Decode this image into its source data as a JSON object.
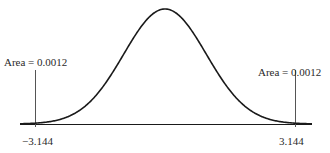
{
  "chart_data": {
    "type": "line",
    "title": "",
    "subtitle": "",
    "xlabel": "",
    "ylabel": "",
    "grid": false,
    "legend": null,
    "xlim": [
      -4,
      4
    ],
    "ylim": [
      0,
      0.42
    ],
    "curve": {
      "distribution": "bell-shaped (normal/t) density",
      "center": 0,
      "x": [
        -4.0,
        -3.5,
        -3.144,
        -3.0,
        -2.5,
        -2.0,
        -1.5,
        -1.0,
        -0.5,
        0.0,
        0.5,
        1.0,
        1.5,
        2.0,
        2.5,
        3.0,
        3.144,
        3.5,
        4.0
      ],
      "y": [
        0.0001,
        0.0009,
        0.0029,
        0.0044,
        0.0175,
        0.054,
        0.1295,
        0.242,
        0.3521,
        0.3989,
        0.3521,
        0.242,
        0.1295,
        0.054,
        0.0175,
        0.0044,
        0.0029,
        0.0009,
        0.0001
      ]
    },
    "tick_labels": [
      "-3.144",
      "3.144"
    ],
    "critical_values": [
      -3.144,
      3.144
    ],
    "annotations": [
      {
        "text": "Area = 0.0012",
        "x": -3.144,
        "position": "above left vertical line"
      },
      {
        "text": "Area = 0.0012",
        "x": 3.144,
        "position": "above right vertical line"
      }
    ],
    "tail_areas": {
      "left": 0.0012,
      "right": 0.0012
    }
  },
  "labels": {
    "left_area": "Area = 0.0012",
    "right_area": "Area = 0.0012",
    "left_tick": "−3.144",
    "right_tick": "3.144"
  },
  "colors": {
    "curve": "#1a1a1a",
    "axis": "#1a1a1a",
    "marker_line": "#555555",
    "text": "#2a2a2a",
    "background": "#ffffff"
  }
}
